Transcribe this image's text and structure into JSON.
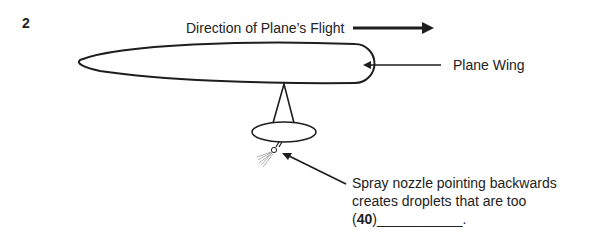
{
  "question": {
    "number": "2"
  },
  "labels": {
    "flight_direction": "Direction of Plane’s Flight",
    "wing": "Plane Wing",
    "nozzle_line1": "Spray nozzle pointing backwards",
    "nozzle_line2": "creates droplets that are too",
    "blank_open": "(",
    "blank_number": "40",
    "blank_close": ")",
    "blank_line": "___________",
    "blank_end": "."
  },
  "colors": {
    "ink": "#1e1e1e",
    "background": "#ffffff"
  }
}
